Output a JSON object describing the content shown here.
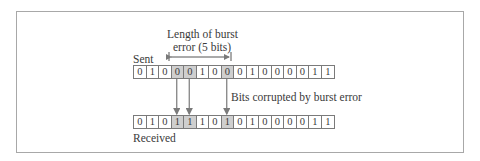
{
  "figure": {
    "burst_label_line1": "Length of  burst",
    "burst_label_line2": "error (5 bits)",
    "sent_label": "Sent",
    "received_label": "Received",
    "corrupted_label": "Bits corrupted by burst error",
    "sent_bits": [
      "0",
      "1",
      "0",
      "0",
      "0",
      "1",
      "0",
      "0",
      "0",
      "1",
      "0",
      "0",
      "0",
      "0",
      "1",
      "1"
    ],
    "received_bits": [
      "0",
      "1",
      "0",
      "1",
      "1",
      "1",
      "0",
      "1",
      "0",
      "1",
      "0",
      "0",
      "0",
      "0",
      "1",
      "1"
    ],
    "corrupted_indices": [
      3,
      4,
      7
    ],
    "burst_length_bits": 5,
    "highlight_color": "#cfcfcf",
    "line_color": "#7a7a7a"
  }
}
